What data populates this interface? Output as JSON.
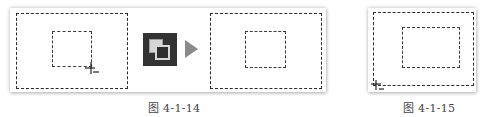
{
  "figures": [
    {
      "caption": "图 4-1-14",
      "icon": "bring-to-front-icon",
      "arrow": "right-arrow-icon",
      "cursor": "crosshair-cursor-icon"
    },
    {
      "caption": "图 4-1-15",
      "cursor": "crosshair-cursor-icon"
    }
  ],
  "colors": {
    "dash": "#2a2a2a",
    "icon_bg": "#333333",
    "arrow": "#8a8a8a",
    "caption": "#444444"
  }
}
